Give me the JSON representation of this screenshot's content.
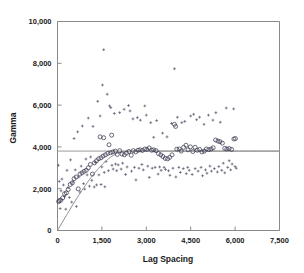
{
  "chart_data": {
    "type": "scatter",
    "title": "",
    "xlabel": "Lag Spacing",
    "ylabel": "Gamma",
    "xlim": [
      0,
      7500
    ],
    "ylim": [
      0,
      10000
    ],
    "grid": false,
    "legend": "none",
    "xticks": [
      0,
      1500,
      3000,
      4500,
      6000,
      7500
    ],
    "xtick_labels": [
      "0",
      "1,500",
      "3,000",
      "4,500",
      "6,000",
      "7,500"
    ],
    "yticks": [
      0,
      2000,
      4000,
      6000,
      8000,
      10000
    ],
    "ytick_labels": [
      "0",
      "2,000",
      "4,000",
      "6,000",
      "8,000",
      "10,000"
    ],
    "series": [
      {
        "name": "experimental-variogram",
        "marker": "open-circle",
        "points": [
          [
            40,
            1380
          ],
          [
            60,
            1430
          ],
          [
            110,
            1450
          ],
          [
            175,
            1560
          ],
          [
            240,
            1760
          ],
          [
            300,
            1800
          ],
          [
            360,
            1960
          ],
          [
            430,
            2200
          ],
          [
            500,
            2280
          ],
          [
            560,
            2480
          ],
          [
            630,
            2560
          ],
          [
            700,
            1990
          ],
          [
            760,
            2700
          ],
          [
            830,
            2760
          ],
          [
            900,
            2830
          ],
          [
            970,
            2880
          ],
          [
            1040,
            3000
          ],
          [
            1110,
            3160
          ],
          [
            1180,
            2700
          ],
          [
            1250,
            3240
          ],
          [
            1320,
            3340
          ],
          [
            1390,
            3430
          ],
          [
            1440,
            4480
          ],
          [
            1470,
            3480
          ],
          [
            1540,
            3560
          ],
          [
            1560,
            4440
          ],
          [
            1620,
            3620
          ],
          [
            1700,
            3690
          ],
          [
            1740,
            4100
          ],
          [
            1790,
            3720
          ],
          [
            1830,
            4560
          ],
          [
            1870,
            3760
          ],
          [
            1950,
            3800
          ],
          [
            2020,
            3640
          ],
          [
            2100,
            3820
          ],
          [
            2180,
            3660
          ],
          [
            2260,
            3620
          ],
          [
            2330,
            3700
          ],
          [
            2410,
            3780
          ],
          [
            2490,
            3600
          ],
          [
            2560,
            3820
          ],
          [
            2640,
            3760
          ],
          [
            2720,
            3840
          ],
          [
            2790,
            3860
          ],
          [
            2870,
            3830
          ],
          [
            2950,
            3900
          ],
          [
            3020,
            3880
          ],
          [
            3100,
            3950
          ],
          [
            3180,
            3840
          ],
          [
            3250,
            3860
          ],
          [
            3330,
            3820
          ],
          [
            3410,
            3680
          ],
          [
            3490,
            3620
          ],
          [
            3560,
            3540
          ],
          [
            3640,
            3450
          ],
          [
            3720,
            3430
          ],
          [
            3790,
            3500
          ],
          [
            3870,
            3620
          ],
          [
            3950,
            5080
          ],
          [
            3990,
            4980
          ],
          [
            4030,
            3890
          ],
          [
            4110,
            3900
          ],
          [
            4180,
            3800
          ],
          [
            4260,
            3980
          ],
          [
            4340,
            4080
          ],
          [
            4410,
            3860
          ],
          [
            4490,
            4000
          ],
          [
            4570,
            3780
          ],
          [
            4650,
            3980
          ],
          [
            4720,
            3840
          ],
          [
            4800,
            3880
          ],
          [
            4880,
            3760
          ],
          [
            4960,
            3800
          ],
          [
            5030,
            3900
          ],
          [
            5110,
            3870
          ],
          [
            5190,
            3900
          ],
          [
            5260,
            3960
          ],
          [
            5340,
            4330
          ],
          [
            5420,
            4280
          ],
          [
            5490,
            4250
          ],
          [
            5570,
            4180
          ],
          [
            5650,
            3930
          ],
          [
            5720,
            3900
          ],
          [
            5800,
            3920
          ],
          [
            5880,
            3880
          ],
          [
            5960,
            4380
          ],
          [
            6010,
            4400
          ]
        ]
      },
      {
        "name": "pair-scatter-cloud",
        "marker": "small-cross",
        "points": [
          [
            30,
            3120
          ],
          [
            60,
            2350
          ],
          [
            90,
            1050
          ],
          [
            120,
            1900
          ],
          [
            150,
            2460
          ],
          [
            200,
            2180
          ],
          [
            240,
            1620
          ],
          [
            280,
            1020
          ],
          [
            320,
            2880
          ],
          [
            360,
            2050
          ],
          [
            400,
            1580
          ],
          [
            440,
            3380
          ],
          [
            480,
            1360
          ],
          [
            520,
            2320
          ],
          [
            560,
            4400
          ],
          [
            600,
            2900
          ],
          [
            640,
            1150
          ],
          [
            680,
            4720
          ],
          [
            720,
            2560
          ],
          [
            760,
            1840
          ],
          [
            800,
            3080
          ],
          [
            840,
            5000
          ],
          [
            880,
            2240
          ],
          [
            920,
            1980
          ],
          [
            960,
            3420
          ],
          [
            1000,
            2660
          ],
          [
            1040,
            5380
          ],
          [
            1080,
            2120
          ],
          [
            1120,
            3520
          ],
          [
            1160,
            2400
          ],
          [
            1200,
            4980
          ],
          [
            1240,
            2080
          ],
          [
            1280,
            3260
          ],
          [
            1320,
            2180
          ],
          [
            1360,
            6180
          ],
          [
            1400,
            2660
          ],
          [
            1440,
            5480
          ],
          [
            1470,
            2200
          ],
          [
            1500,
            3040
          ],
          [
            1520,
            6960
          ],
          [
            1560,
            8650
          ],
          [
            1580,
            2780
          ],
          [
            1600,
            2090
          ],
          [
            1640,
            3300
          ],
          [
            1680,
            6520
          ],
          [
            1720,
            2860
          ],
          [
            1760,
            5960
          ],
          [
            1800,
            5880
          ],
          [
            1840,
            3120
          ],
          [
            1880,
            2940
          ],
          [
            1920,
            5600
          ],
          [
            1960,
            3180
          ],
          [
            2000,
            2860
          ],
          [
            2050,
            3140
          ],
          [
            2100,
            5640
          ],
          [
            2150,
            2940
          ],
          [
            2200,
            3220
          ],
          [
            2250,
            5800
          ],
          [
            2300,
            2680
          ],
          [
            2350,
            3040
          ],
          [
            2400,
            5980
          ],
          [
            2450,
            5720
          ],
          [
            2500,
            2840
          ],
          [
            2550,
            5340
          ],
          [
            2600,
            3020
          ],
          [
            2650,
            2420
          ],
          [
            2700,
            5400
          ],
          [
            2750,
            2980
          ],
          [
            2800,
            5280
          ],
          [
            2850,
            3160
          ],
          [
            2900,
            2900
          ],
          [
            2950,
            5960
          ],
          [
            3000,
            5520
          ],
          [
            3050,
            3080
          ],
          [
            3100,
            2540
          ],
          [
            3150,
            5160
          ],
          [
            3200,
            2980
          ],
          [
            3250,
            4460
          ],
          [
            3300,
            3020
          ],
          [
            3350,
            5260
          ],
          [
            3400,
            2700
          ],
          [
            3450,
            3040
          ],
          [
            3500,
            2880
          ],
          [
            3550,
            4660
          ],
          [
            3600,
            3020
          ],
          [
            3650,
            2920
          ],
          [
            3700,
            4480
          ],
          [
            3750,
            2860
          ],
          [
            3800,
            2640
          ],
          [
            3850,
            5120
          ],
          [
            3900,
            2980
          ],
          [
            3950,
            7740
          ],
          [
            4000,
            2560
          ],
          [
            4050,
            5420
          ],
          [
            4100,
            3020
          ],
          [
            4150,
            2780
          ],
          [
            4200,
            5160
          ],
          [
            4250,
            2960
          ],
          [
            4300,
            5220
          ],
          [
            4350,
            2720
          ],
          [
            4400,
            3020
          ],
          [
            4450,
            2880
          ],
          [
            4500,
            5480
          ],
          [
            4550,
            2680
          ],
          [
            4600,
            5560
          ],
          [
            4650,
            2960
          ],
          [
            4700,
            5300
          ],
          [
            4750,
            2840
          ],
          [
            4800,
            5420
          ],
          [
            4850,
            3020
          ],
          [
            4900,
            2620
          ],
          [
            4950,
            5080
          ],
          [
            5000,
            2900
          ],
          [
            5050,
            2740
          ],
          [
            5100,
            5520
          ],
          [
            5150,
            3080
          ],
          [
            5200,
            2840
          ],
          [
            5250,
            5280
          ],
          [
            5300,
            2960
          ],
          [
            5350,
            5640
          ],
          [
            5400,
            2800
          ],
          [
            5450,
            3060
          ],
          [
            5500,
            5180
          ],
          [
            5550,
            2880
          ],
          [
            5600,
            3220
          ],
          [
            5650,
            2760
          ],
          [
            5700,
            5860
          ],
          [
            5750,
            3020
          ],
          [
            5800,
            3340
          ],
          [
            5850,
            2900
          ],
          [
            5900,
            3180
          ],
          [
            5950,
            5820
          ],
          [
            6000,
            3060
          ],
          [
            6040,
            2980
          ]
        ]
      }
    ],
    "fit_curve": {
      "name": "variogram-model",
      "sill": 3800,
      "range": 2350,
      "nugget": 0,
      "model": "spherical"
    },
    "sill_line": {
      "name": "sill-reference-line",
      "value": 3800,
      "x_start": 0,
      "x_end": 7500
    }
  },
  "colors": {
    "axis": "#8a8a8a",
    "text": "#1a1a1a",
    "circle_marker": "#3a3a50",
    "cross_marker": "#55556b",
    "curve": "#8d8d8d",
    "sill": "#9a9a9a",
    "background": "#ffffff"
  }
}
